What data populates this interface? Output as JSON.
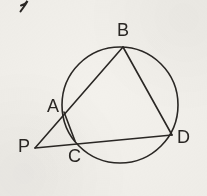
{
  "figure": {
    "background_color": "#f3f1ec",
    "ink_color": "#2a2724",
    "stroke_width": 1.6,
    "labels": {
      "A": "A",
      "B": "B",
      "C": "C",
      "D": "D",
      "P": "P"
    },
    "stray_mark": {
      "name": "pen-stray-mark",
      "description": "partial handwritten stroke fragment at top-left corner"
    }
  },
  "chart_data": {
    "type": "diagram",
    "subtype": "euclidean-geometry",
    "canvas": {
      "width": 207,
      "height": 196
    },
    "circle": {
      "name": "circumscribed-circle",
      "cx": 120,
      "cy": 105,
      "r": 58
    },
    "points": [
      {
        "id": "A",
        "label": "A",
        "x": 64,
        "y": 112,
        "on_circle": true,
        "label_x": 47,
        "label_y": 97
      },
      {
        "id": "B",
        "label": "B",
        "x": 123,
        "y": 47,
        "on_circle": true,
        "label_x": 117,
        "label_y": 21
      },
      {
        "id": "C",
        "label": "C",
        "x": 75,
        "y": 141,
        "on_circle": true,
        "label_x": 68,
        "label_y": 147
      },
      {
        "id": "D",
        "label": "D",
        "x": 172,
        "y": 135,
        "on_circle": true,
        "label_x": 177,
        "label_y": 128
      },
      {
        "id": "P",
        "label": "P",
        "x": 35,
        "y": 148,
        "on_circle": false,
        "label_x": 18,
        "label_y": 137
      }
    ],
    "segments": [
      {
        "name": "segment-PB",
        "from": "P",
        "to": "B",
        "through": [
          "A"
        ],
        "x1": 35,
        "y1": 148,
        "x2": 123,
        "y2": 47
      },
      {
        "name": "segment-PD",
        "from": "P",
        "to": "D",
        "through": [
          "C"
        ],
        "x1": 35,
        "y1": 148,
        "x2": 172,
        "y2": 135
      },
      {
        "name": "segment-BD",
        "from": "B",
        "to": "D",
        "x1": 123,
        "y1": 47,
        "x2": 172,
        "y2": 135
      },
      {
        "name": "segment-AC",
        "from": "A",
        "to": "C",
        "x1": 64,
        "y1": 112,
        "x2": 75,
        "y2": 141
      }
    ]
  }
}
